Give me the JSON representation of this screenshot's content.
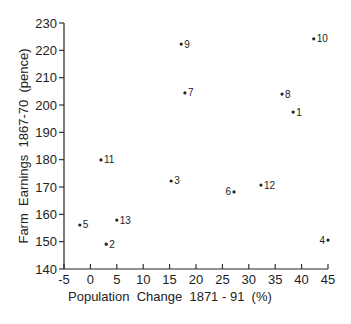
{
  "chart_data": {
    "type": "scatter",
    "title": "",
    "xlabel": "Population  Change  1871 - 91  (%)",
    "ylabel": "Farm  Earnings  1867-70  (pence)",
    "xlim": [
      -5,
      45
    ],
    "ylim": [
      140,
      230
    ],
    "xticks": [
      -5,
      0,
      5,
      10,
      15,
      20,
      25,
      30,
      35,
      40,
      45
    ],
    "yticks": [
      140,
      150,
      160,
      170,
      180,
      190,
      200,
      210,
      220,
      230
    ],
    "grid": false,
    "legend": null,
    "points": [
      {
        "label": "1",
        "x": 38.4,
        "y": 197.4,
        "label_side": "right"
      },
      {
        "label": "2",
        "x": 3.0,
        "y": 149.1,
        "label_side": "right"
      },
      {
        "label": "3",
        "x": 15.3,
        "y": 172.2,
        "label_side": "right"
      },
      {
        "label": "4",
        "x": 45.0,
        "y": 150.6,
        "label_side": "left"
      },
      {
        "label": "5",
        "x": -2.0,
        "y": 156.1,
        "label_side": "right"
      },
      {
        "label": "6",
        "x": 27.2,
        "y": 168.2,
        "label_side": "left"
      },
      {
        "label": "7",
        "x": 17.9,
        "y": 204.4,
        "label_side": "right"
      },
      {
        "label": "8",
        "x": 36.3,
        "y": 204.0,
        "label_side": "right"
      },
      {
        "label": "9",
        "x": 17.2,
        "y": 222.3,
        "label_side": "right"
      },
      {
        "label": "10",
        "x": 42.3,
        "y": 224.2,
        "label_side": "right"
      },
      {
        "label": "11",
        "x": 2.0,
        "y": 179.9,
        "label_side": "right"
      },
      {
        "label": "12",
        "x": 32.3,
        "y": 170.7,
        "label_side": "right"
      },
      {
        "label": "13",
        "x": 5.0,
        "y": 157.9,
        "label_side": "right"
      }
    ]
  }
}
